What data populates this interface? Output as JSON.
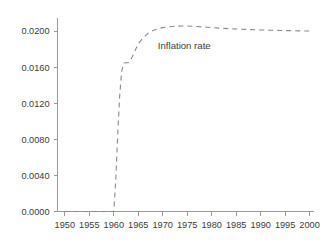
{
  "chart_data": {
    "type": "line",
    "title": "",
    "subtitle": "",
    "xlabel": "",
    "ylabel": "",
    "xlim": [
      1948.5,
      2000.8
    ],
    "ylim": [
      0.0,
      0.0215
    ],
    "grid": false,
    "legend_position": "none",
    "background_color": "#ffffff",
    "line_color": "#8a8a8a",
    "line_style": "dashed",
    "axis_color": "#9a9a9a",
    "text_color": "#3a3a3a",
    "xticks": [
      1950,
      1955,
      1960,
      1965,
      1970,
      1975,
      1980,
      1985,
      1990,
      1995,
      2000
    ],
    "xtick_labels": [
      "1950",
      "1955",
      "1960",
      "1965",
      "1970",
      "1975",
      "1980",
      "1985",
      "1990",
      "1995",
      "2000"
    ],
    "yticks": [
      0.0,
      0.004,
      0.008,
      0.012,
      0.016,
      0.02
    ],
    "ytick_labels": [
      "0.0000",
      "0.0040",
      "0.0080",
      "0.0120",
      "0.0160",
      "0.0200"
    ],
    "annotations": [
      {
        "text": "Inflation rate",
        "x": 1969.0,
        "y": 0.018
      }
    ],
    "series": [
      {
        "name": "Inflation rate",
        "x": [
          1950,
          1951,
          1952,
          1953,
          1954,
          1955,
          1956,
          1957,
          1958,
          1959,
          1960,
          1960.4,
          1960.8,
          1961.2,
          1961.6,
          1962,
          1962.6,
          1963,
          1963.5,
          1964,
          1964.5,
          1965,
          1966,
          1967,
          1968,
          1969,
          1970,
          1971,
          1972,
          1973,
          1974,
          1975,
          1976,
          1977,
          1978,
          1979,
          1980,
          1982,
          1984,
          1986,
          1988,
          1990,
          1992,
          1994,
          1996,
          1998,
          2000
        ],
        "y": [
          0.0,
          0.0,
          0.0,
          0.0,
          0.0,
          0.0,
          0.0,
          0.0,
          0.0,
          0.0,
          0.0,
          0.0035,
          0.0085,
          0.0128,
          0.0155,
          0.01645,
          0.01648,
          0.0165,
          0.01685,
          0.0174,
          0.018,
          0.0186,
          0.01925,
          0.01975,
          0.02005,
          0.02025,
          0.02038,
          0.02046,
          0.02051,
          0.02054,
          0.02055,
          0.02055,
          0.02053,
          0.0205,
          0.02046,
          0.02042,
          0.02038,
          0.02031,
          0.02025,
          0.0202,
          0.02016,
          0.02012,
          0.02009,
          0.02006,
          0.02004,
          0.02002,
          0.02
        ]
      }
    ]
  }
}
